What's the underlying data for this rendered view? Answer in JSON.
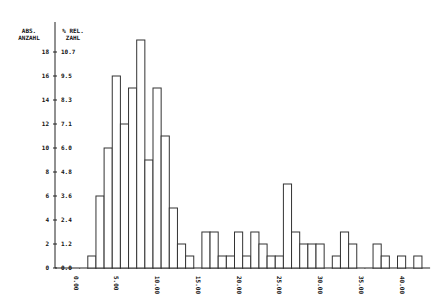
{
  "chart_data": {
    "type": "bar",
    "title": "",
    "ylabel_left": "ABS. ANZAHL",
    "ylabel_right": "% REL. ZAHL",
    "xlabel": "",
    "bin_width": 1,
    "x_start": 2,
    "values": [
      1,
      6,
      10,
      16,
      12,
      15,
      19,
      9,
      15,
      11,
      5,
      2,
      1,
      0,
      3,
      3,
      1,
      1,
      3,
      1,
      3,
      2,
      1,
      1,
      7,
      3,
      2,
      2,
      2,
      0,
      1,
      3,
      2,
      0,
      0,
      2,
      1,
      0,
      1,
      0,
      1
    ],
    "y_ticks_abs": [
      "0",
      "2",
      "4",
      "6",
      "8",
      "10",
      "12",
      "14",
      "16",
      "18"
    ],
    "y_ticks_rel": [
      "0.0",
      "1.2",
      "2.4",
      "3.6",
      "4.8",
      "6.0",
      "7.1",
      "8.3",
      "9.5",
      "10.7"
    ],
    "x_ticks": [
      "0.00",
      "5.00",
      "10.00",
      "15.00",
      "20.00",
      "25.00",
      "30.00",
      "35.00",
      "40.00"
    ],
    "xlim": [
      0,
      43
    ],
    "ylim": [
      0,
      19
    ],
    "grid": false,
    "legend": null
  },
  "header": {
    "abs_line1": "ABS.",
    "abs_line2": "ANZAHL",
    "rel_line1": "% REL.",
    "rel_line2": "ZAHL"
  }
}
